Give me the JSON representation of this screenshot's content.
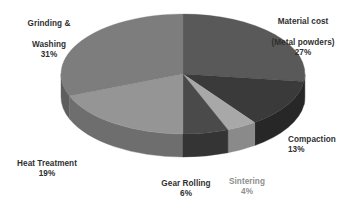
{
  "chart_data": {
    "type": "pie",
    "title": "",
    "subtitle": "",
    "xlabel": "",
    "ylabel": "",
    "legend_position": "none",
    "grid": false,
    "style": "3d-exploded-none",
    "units": "percent",
    "total": 100,
    "categories": [
      "Material cost (Metal powders)",
      "Compaction",
      "Sintering",
      "Gear Rolling",
      "Heat Treatment",
      "Grinding & Washing"
    ],
    "values": [
      27,
      13,
      4,
      6,
      19,
      31
    ],
    "slices": [
      {
        "name": "material-cost",
        "label_line1": "Material cost",
        "label_line2": "(Metal powders)",
        "percent_text": "27%",
        "value": 27,
        "top_color": "#595959",
        "side_color": "#3f3f3f",
        "label_color": "#2f2f2f"
      },
      {
        "name": "compaction",
        "label_line1": "Compaction",
        "label_line2": "",
        "percent_text": "13%",
        "value": 13,
        "top_color": "#3a3a3a",
        "side_color": "#272727",
        "label_color": "#2f2f2f"
      },
      {
        "name": "sintering",
        "label_line1": "Sintering",
        "label_line2": "",
        "percent_text": "4%",
        "value": 4,
        "top_color": "#a8a8a8",
        "side_color": "#8a8a8a",
        "label_color": "#8e8e8e"
      },
      {
        "name": "gear-rolling",
        "label_line1": "Gear Rolling",
        "label_line2": "",
        "percent_text": "6%",
        "value": 6,
        "top_color": "#4a4a4a",
        "side_color": "#343434",
        "label_color": "#2f2f2f"
      },
      {
        "name": "heat-treatment",
        "label_line1": "Heat Treatment",
        "label_line2": "",
        "percent_text": "19%",
        "value": 19,
        "top_color": "#959595",
        "side_color": "#6e6e6e",
        "label_color": "#2f2f2f"
      },
      {
        "name": "grinding-washing",
        "label_line1": "Grinding &",
        "label_line2": "Washing",
        "percent_text": "31%",
        "value": 31,
        "top_color": "#7d7d7d",
        "side_color": "#5e5e5e",
        "label_color": "#2f2f2f"
      }
    ],
    "geometry": {
      "cx": 183,
      "cy": 74,
      "rx": 122,
      "ry": 60,
      "depth": 23,
      "start_angle_deg": -90,
      "direction": "clockwise"
    },
    "background_color": "#ffffff"
  }
}
